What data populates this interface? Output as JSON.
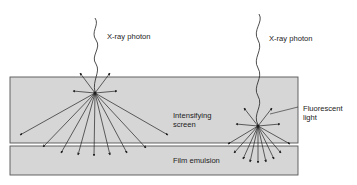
{
  "diagram": {
    "labels": {
      "photon_left": "X-ray photon",
      "photon_right": "X-ray photon",
      "screen_line1": "Intensifying",
      "screen_line2": "screen",
      "fluorescent_line1": "Fluorescent",
      "fluorescent_line2": "light",
      "film": "Film emulsion"
    },
    "colors": {
      "band_fill": "#d6d6d6",
      "band_stroke": "#555555",
      "line": "#222222"
    }
  }
}
